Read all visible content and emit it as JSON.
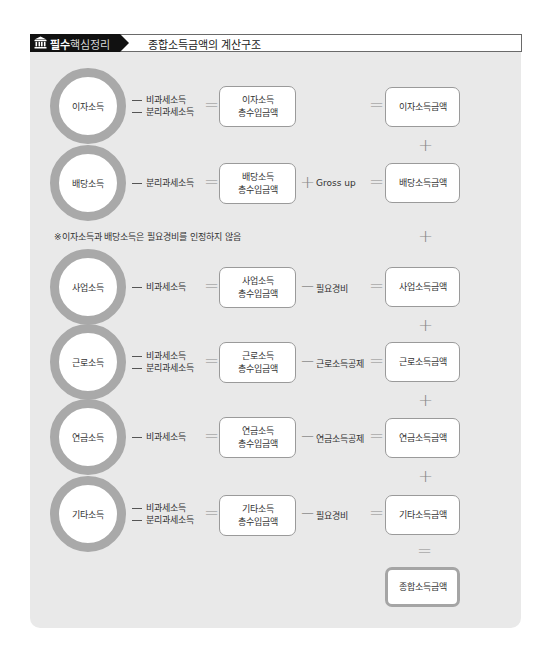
{
  "header": {
    "tag_icon": "bank-building-icon",
    "tag_bold": "필수",
    "tag_light": "핵심정리",
    "title": "종합소득금액의 계산구조"
  },
  "colors": {
    "panel_bg": "#e9e9e9",
    "circle_ring": "#a9a9a9",
    "box_border": "#9a9a9a",
    "tag_bg": "#111111"
  },
  "rows": [
    {
      "income": "이자소득",
      "deductions": [
        "비과세소득",
        "분리과세소득"
      ],
      "gross_line1": "이자소득",
      "gross_line2": "총수입금액",
      "adjust_op": "",
      "adjust": "",
      "result": "이자소득금액"
    },
    {
      "income": "배당소득",
      "deductions": [
        "분리과세소득"
      ],
      "gross_line1": "배당소득",
      "gross_line2": "총수입금액",
      "adjust_op": "+",
      "adjust": "Gross up",
      "result": "배당소득금액"
    },
    {
      "income": "사업소득",
      "deductions": [
        "비과세소득"
      ],
      "gross_line1": "사업소득",
      "gross_line2": "총수입금액",
      "adjust_op": "−",
      "adjust": "필요경비",
      "result": "사업소득금액"
    },
    {
      "income": "근로소득",
      "deductions": [
        "비과세소득",
        "분리과세소득"
      ],
      "gross_line1": "근로소득",
      "gross_line2": "총수입금액",
      "adjust_op": "−",
      "adjust": "근로소득공제",
      "result": "근로소득금액"
    },
    {
      "income": "연금소득",
      "deductions": [
        "비과세소득"
      ],
      "gross_line1": "연금소득",
      "gross_line2": "총수입금액",
      "adjust_op": "−",
      "adjust": "연금소득공제",
      "result": "연금소득금액"
    },
    {
      "income": "기타소득",
      "deductions": [
        "비과세소득",
        "분리과세소득"
      ],
      "gross_line1": "기타소득",
      "gross_line2": "총수입금액",
      "adjust_op": "−",
      "adjust": "필요경비",
      "result": "기타소득금액"
    }
  ],
  "operators": {
    "plus": "+",
    "equals": "="
  },
  "note": "※이자소득과 배당소득은 필요경비를 인정하지 않음",
  "total": "종합소득금액"
}
